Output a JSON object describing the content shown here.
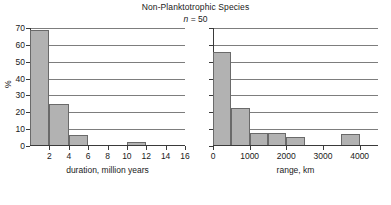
{
  "figure": {
    "title": "Non-Planktotrophic Species",
    "subtitle_symbol": "n",
    "subtitle_rest": " =  50",
    "ylabel": "%",
    "bar_fill_color": "#b2b2b2",
    "bar_edge_color": "#6a6a6a",
    "gridline_color": "#7d7d7d",
    "axis_color": "#3a3a3a",
    "background_color": "#ffffff"
  },
  "chart_data": [
    {
      "type": "bar",
      "name": "duration-histogram",
      "title": "Non-Planktotrophic Species",
      "annotation": "n = 50",
      "xlabel": "duration, million years",
      "ylabel": "%",
      "xlim": [
        0,
        16
      ],
      "ylim": [
        0,
        70
      ],
      "grid": true,
      "legend": false,
      "bin_width": 2,
      "xticks": [
        2,
        4,
        6,
        8,
        10,
        12,
        14,
        16
      ],
      "xticklabels": [
        "2",
        "4",
        "6",
        "8",
        "10",
        "12",
        "14",
        "16"
      ],
      "yticks": [
        0,
        10,
        20,
        30,
        40,
        50,
        60,
        70
      ],
      "yticklabels": [
        "0",
        "10",
        "20",
        "30",
        "40",
        "50",
        "60",
        "70"
      ],
      "bins": [
        {
          "x0": 0,
          "x1": 2,
          "value": 69
        },
        {
          "x0": 2,
          "x1": 4,
          "value": 25
        },
        {
          "x0": 4,
          "x1": 6,
          "value": 6.5
        },
        {
          "x0": 6,
          "x1": 8,
          "value": 0
        },
        {
          "x0": 8,
          "x1": 10,
          "value": 0
        },
        {
          "x0": 10,
          "x1": 12,
          "value": 2.5
        },
        {
          "x0": 12,
          "x1": 14,
          "value": 0
        },
        {
          "x0": 14,
          "x1": 16,
          "value": 0
        }
      ],
      "categories": [
        "0-2",
        "2-4",
        "4-6",
        "6-8",
        "8-10",
        "10-12",
        "12-14",
        "14-16"
      ],
      "values": [
        69,
        25,
        6.5,
        0,
        0,
        2.5,
        0,
        0
      ]
    },
    {
      "type": "bar",
      "name": "range-histogram",
      "xlabel": "range, km",
      "ylabel": "%",
      "xlim": [
        0,
        4500
      ],
      "ylim": [
        0,
        70
      ],
      "grid": true,
      "legend": false,
      "bin_width": 500,
      "xticks": [
        0,
        1000,
        2000,
        3000,
        4000
      ],
      "xticklabels": [
        "0",
        "1000",
        "2000",
        "3000",
        "4000"
      ],
      "yticks": [
        0,
        10,
        20,
        30,
        40,
        50,
        60,
        70
      ],
      "yticklabels": [
        "",
        "",
        "",
        "",
        "",
        "",
        "",
        ""
      ],
      "bins": [
        {
          "x0": 0,
          "x1": 500,
          "value": 56
        },
        {
          "x0": 500,
          "x1": 1000,
          "value": 22.5
        },
        {
          "x0": 1000,
          "x1": 1500,
          "value": 7.5
        },
        {
          "x0": 1500,
          "x1": 2000,
          "value": 7.5
        },
        {
          "x0": 2000,
          "x1": 2500,
          "value": 5.5
        },
        {
          "x0": 2500,
          "x1": 3000,
          "value": 0
        },
        {
          "x0": 3000,
          "x1": 3500,
          "value": 0
        },
        {
          "x0": 3500,
          "x1": 4000,
          "value": 7
        },
        {
          "x0": 4000,
          "x1": 4500,
          "value": 0
        }
      ],
      "categories": [
        "0-500",
        "500-1000",
        "1000-1500",
        "1500-2000",
        "2000-2500",
        "2500-3000",
        "3000-3500",
        "3500-4000",
        "4000-4500"
      ],
      "values": [
        56,
        22.5,
        7.5,
        7.5,
        5.5,
        0,
        0,
        7,
        0
      ]
    }
  ]
}
